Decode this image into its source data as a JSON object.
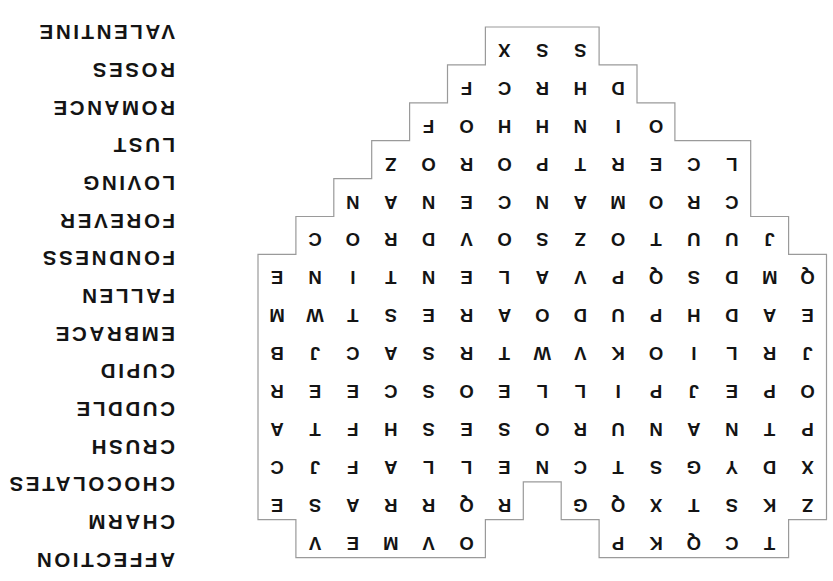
{
  "grid": {
    "rows": [
      [
        "",
        "T",
        "C",
        "Q",
        "K",
        "P",
        "",
        "",
        "",
        "O",
        "V",
        "M",
        "E",
        "V",
        ""
      ],
      [
        "Z",
        "K",
        "S",
        "T",
        "X",
        "Q",
        "G",
        "",
        "R",
        "Q",
        "R",
        "R",
        "A",
        "S",
        "E"
      ],
      [
        "X",
        "D",
        "Y",
        "G",
        "S",
        "T",
        "C",
        "N",
        "E",
        "L",
        "L",
        "A",
        "F",
        "J",
        "C"
      ],
      [
        "P",
        "T",
        "N",
        "A",
        "N",
        "U",
        "R",
        "O",
        "S",
        "E",
        "S",
        "H",
        "F",
        "T",
        "A"
      ],
      [
        "O",
        "P",
        "E",
        "J",
        "P",
        "I",
        "L",
        "L",
        "E",
        "O",
        "S",
        "C",
        "E",
        "E",
        "R"
      ],
      [
        "J",
        "R",
        "L",
        "I",
        "O",
        "K",
        "V",
        "W",
        "T",
        "R",
        "S",
        "A",
        "C",
        "J",
        "B"
      ],
      [
        "E",
        "A",
        "D",
        "H",
        "P",
        "U",
        "D",
        "O",
        "A",
        "R",
        "E",
        "S",
        "T",
        "W",
        "M"
      ],
      [
        "Q",
        "M",
        "D",
        "S",
        "Q",
        "P",
        "V",
        "A",
        "L",
        "E",
        "N",
        "T",
        "I",
        "N",
        "E"
      ],
      [
        "",
        "J",
        "U",
        "U",
        "T",
        "O",
        "Z",
        "S",
        "O",
        "V",
        "D",
        "R",
        "O",
        "C",
        ""
      ],
      [
        "",
        "",
        "C",
        "R",
        "O",
        "M",
        "A",
        "N",
        "C",
        "E",
        "N",
        "A",
        "N",
        "",
        ""
      ],
      [
        "",
        "",
        "L",
        "C",
        "E",
        "R",
        "T",
        "P",
        "O",
        "R",
        "O",
        "Z",
        "",
        "",
        ""
      ],
      [
        "",
        "",
        "",
        "",
        "O",
        "I",
        "N",
        "H",
        "H",
        "O",
        "F",
        "",
        "",
        "",
        ""
      ],
      [
        "",
        "",
        "",
        "",
        "",
        "D",
        "H",
        "R",
        "C",
        "F",
        "",
        "",
        "",
        "",
        ""
      ],
      [
        "",
        "",
        "",
        "",
        "",
        "",
        "S",
        "S",
        "X",
        "",
        "",
        "",
        "",
        "",
        ""
      ]
    ]
  },
  "word_list": [
    "AFFECTION",
    "CHARM",
    "CHOCOLATES",
    "CRUSH",
    "CUDDLE",
    "CUPID",
    "EMBRACE",
    "FALLEN",
    "FONDNESS",
    "FOREVER",
    "LOVING",
    "LUST",
    "ROMANCE",
    "ROSES",
    "VALENTINE"
  ],
  "colors": {
    "text": "#141414",
    "outline": "#9a9a9a",
    "background": "#ffffff"
  }
}
